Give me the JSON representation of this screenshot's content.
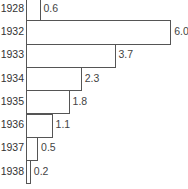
{
  "chart_data": {
    "type": "bar",
    "orientation": "horizontal",
    "title": "",
    "xlabel": "",
    "ylabel": "",
    "categories": [
      "1928",
      "1932",
      "1933",
      "1934",
      "1935",
      "1936",
      "1937",
      "1938"
    ],
    "values": [
      0.6,
      6.0,
      3.7,
      2.3,
      1.8,
      1.1,
      0.5,
      0.2
    ],
    "value_labels": [
      "0.6",
      "6.0",
      "3.7",
      "2.3",
      "1.8",
      "1.1",
      "0.5",
      "0.2"
    ],
    "xlim": [
      0,
      6.0
    ],
    "grid": false,
    "legend": null
  },
  "colors": {
    "bar_fill": "#ffffff",
    "bar_stroke": "#555555",
    "text": "#333333"
  }
}
